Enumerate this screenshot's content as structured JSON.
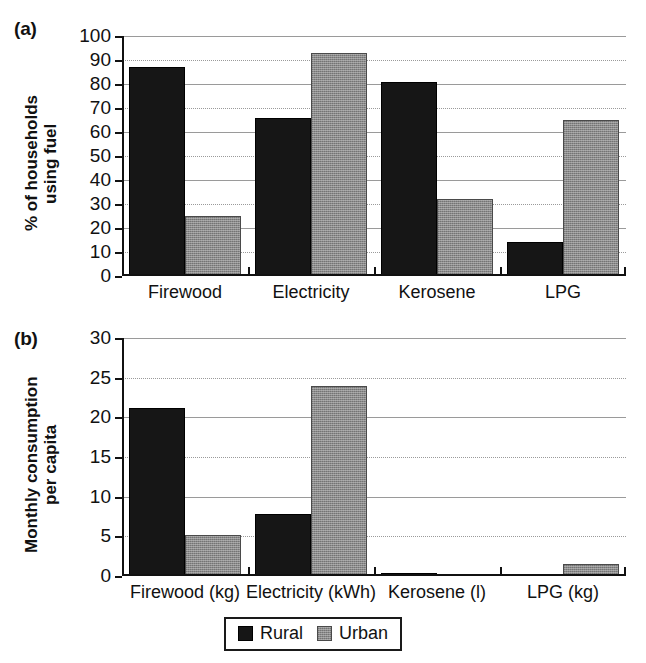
{
  "figure": {
    "background_color": "#ffffff",
    "series_colors": {
      "rural": "#161616",
      "urban": "#8a8a8a"
    }
  },
  "panel_a": {
    "tag": "(a)",
    "ylabel": "% of households\nusing fuel"
  },
  "panel_b": {
    "tag": "(b)",
    "ylabel": "Monthly consumption\nper capita"
  },
  "legend": {
    "entries": [
      {
        "label": "Rural",
        "color": "#161616"
      },
      {
        "label": "Urban",
        "color": "#8a8a8a"
      }
    ]
  },
  "chart_data": [
    {
      "id": "panel_a",
      "type": "bar",
      "title": "(a)",
      "xlabel": "",
      "ylabel": "% of households using fuel",
      "ylim": [
        0,
        100
      ],
      "yticks": [
        0,
        10,
        20,
        30,
        40,
        50,
        60,
        70,
        80,
        90,
        100
      ],
      "ytick_labels": [
        "0",
        "10",
        "20",
        "30",
        "40",
        "50",
        "60",
        "70",
        "80",
        "90",
        "100"
      ],
      "grid": true,
      "legend_position": "below-figure",
      "categories": [
        "Firewood",
        "Electricity",
        "Kerosene",
        "LPG"
      ],
      "series": [
        {
          "name": "Rural",
          "color": "#161616",
          "values": [
            87,
            66,
            81,
            14
          ]
        },
        {
          "name": "Urban",
          "color": "#8a8a8a",
          "values": [
            25,
            93,
            32,
            65
          ]
        }
      ]
    },
    {
      "id": "panel_b",
      "type": "bar",
      "title": "(b)",
      "xlabel": "",
      "ylabel": "Monthly consumption per capita",
      "ylim": [
        0,
        30
      ],
      "yticks": [
        0,
        5,
        10,
        15,
        20,
        25,
        30
      ],
      "ytick_labels": [
        "0",
        "5",
        "10",
        "15",
        "20",
        "25",
        "30"
      ],
      "grid": true,
      "legend_position": "below-figure",
      "categories": [
        "Firewood (kg)",
        "Electricity (kWh)",
        "Kerosene (l)",
        "LPG (kg)"
      ],
      "series": [
        {
          "name": "Rural",
          "color": "#161616",
          "values": [
            21.2,
            7.8,
            0.4,
            0.15
          ]
        },
        {
          "name": "Urban",
          "color": "#8a8a8a",
          "values": [
            5.2,
            24.0,
            0.25,
            1.5
          ]
        }
      ]
    }
  ]
}
